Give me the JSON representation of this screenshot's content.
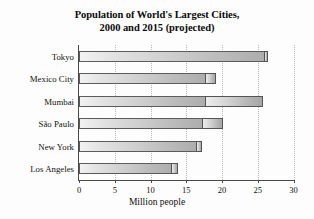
{
  "chart_data": {
    "type": "bar",
    "orientation": "horizontal",
    "title": "Population of World's Largest Cities, 2000 and 2015 (projected)",
    "title_lines": [
      "Population of World's Largest Cities,",
      "2000 and 2015 (projected)"
    ],
    "xlabel": "Million people",
    "ylabel": "",
    "xlim": [
      0,
      30
    ],
    "xticks": [
      0,
      5,
      10,
      15,
      20,
      25,
      30
    ],
    "xtick_labels": [
      "0",
      "5",
      "10",
      "15",
      "20",
      "25",
      "30"
    ],
    "grid": "vertical-dotted",
    "legend": "none",
    "categories": [
      "Tokyo",
      "Mexico City",
      "Mumbai",
      "São Paulo",
      "New York",
      "Los Angeles"
    ],
    "series": [
      {
        "name": "2000",
        "values": [
          26.0,
          17.8,
          17.8,
          17.4,
          16.5,
          13.0
        ]
      },
      {
        "name": "2015 (projected)",
        "values": [
          26.4,
          19.2,
          25.8,
          20.2,
          17.2,
          13.8
        ]
      }
    ]
  },
  "colors": {
    "axis": "#4a4a4a",
    "grid": "#b9b9b9",
    "bar_2000_start": "#f2f2f2",
    "bar_2000_end": "#adadad",
    "bar_2015_start": "#ededed",
    "bar_2015_end": "#a6a6a6",
    "text": "#111111",
    "background": "#fdfdfd"
  }
}
